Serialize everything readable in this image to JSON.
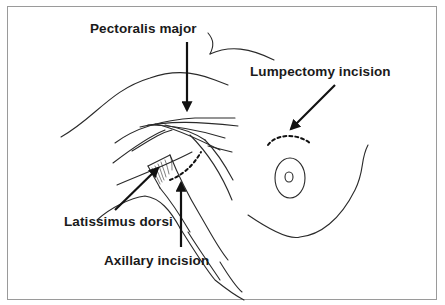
{
  "figure": {
    "labels": {
      "pectoralis": "Pectoralis major",
      "lumpectomy": "Lumpectomy incision",
      "latissimus": "Latissimus dorsi",
      "axillary": "Axillary incision"
    },
    "colors": {
      "line": "#2a2a2a",
      "arrow": "#111111",
      "frame": "#9a9a9a",
      "background": "#ffffff"
    }
  }
}
